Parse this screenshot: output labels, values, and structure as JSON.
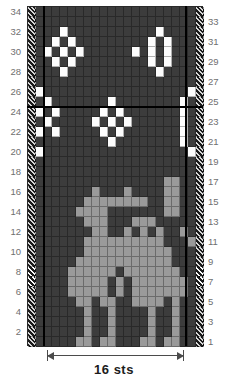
{
  "chart": {
    "type": "knitting-chart",
    "rows": 34,
    "columns": 22,
    "cell_legend": {
      "D": "dark main colour",
      "W": "white contrast colour",
      "G": "grey motif colour",
      "E": "edge / selvedge stitch (hatched)",
      "EW": "edge / selvedge stitch over white ground (hatched)"
    },
    "repeat": {
      "label": "16 sts",
      "start_column": 3,
      "end_column": 18
    },
    "row_numbers_left": [
      "34",
      "32",
      "30",
      "28",
      "26",
      "24",
      "22",
      "20",
      "18",
      "16",
      "14",
      "12",
      "10",
      "8",
      "6",
      "4",
      "2"
    ],
    "row_numbers_right": [
      "33",
      "31",
      "29",
      "27",
      "25",
      "23",
      "21",
      "19",
      "17",
      "15",
      "13",
      "11",
      "9",
      "7",
      "5",
      "3",
      "1"
    ],
    "sections": [
      {
        "name": "diamond-border",
        "rows": "25-34"
      },
      {
        "name": "reindeer-panel",
        "rows": "9-24"
      },
      {
        "name": "plain-band",
        "rows": "7-8"
      },
      {
        "name": "peerie-border",
        "rows": "1-6"
      }
    ],
    "grid": [
      "EDDDDDDDDDDDDDDDDDDDDE",
      "EDDDDDDDDDDDDDDDDDDDDE",
      "EDDDWDDDDDDDDDDDWDDDDE",
      "EDDWDWDDDDDDDDDWDWDDDE",
      "EDWDWDWDDDDDDWDWDWDDDE",
      "EDDWDWDDDDDDDDDWDWDDDE",
      "EDDDWDDDDDDDDDDDWDDDDE",
      "EDDDDDDDDDDDDDDDDDDDDE",
      "EWDDDDDDDDDDDDDDDDDDWE",
      "EDWDDDDDDDWDDDDDDDDWDE",
      "EWDWDDDDDWDWDDDDDDDWDE",
      "EDWDDDDDWDWDWDDDDDDWDE",
      "EWDWDDDDDWDWDDDDDDDWDE",
      "EDDDDDDDDDWDDDDDDDDWDE",
      "EWDDDDDDDDDDDDDDDDDDWE",
      "EDDDDDDDDDDDDDDDDDDDDE",
      "EDDDDDDDDDDDDDDDDDDDDE",
      "EDDDDDDDDDDDDDDDDGGDDE",
      "EDDDDDDDGDDDGDDDDGGDDE",
      "EDDDDDDGGGGGGGGDDGGDDE",
      "EDDDDDGGGGDDDDDDDGGDDE",
      "EDDDDDDGGGDDDGGGDDDDDE",
      "EDDDDDDDGGDDGDGDGDDGDE",
      "EDDDDDDGGGGGGGGGGDDDGE",
      "EDDDDDDGGGGGGGGGGGDDDE",
      "EDDDDDGGGGGGGGGGGGDDDE",
      "EDDDDGGGGGGDGGGGGGGDDE",
      "EDDDDGGGGGDGDGGGGGGGDE",
      "EDDDDGGGGGDGDGGGGGGGDE",
      "EDDDDDGGDGGDDGGGGDGDDE",
      "EDDDDDDGDDGDDDDGDDGDDE",
      "EDDDDDDGDDGDDDDGDDGDDE",
      "EDDDDDDGDDGDDDDGDDGDDE",
      "EDDDDDGGDGGDDDGGDGGDDE",
      "EWWWWWWWWWWWWWWWWWWWWE",
      "EWWWWWWWWWWWWWWWWWWWWE",
      "EWDWDWDWDWDWDWDWDWDWDW",
      "EWDWDWDWDWDWDWDWDWDWDW",
      "EDWDWDWDWDWDWDWDWDWDWD",
      "EWWDWDDWDWWWWDWDDWDWWE"
    ]
  }
}
